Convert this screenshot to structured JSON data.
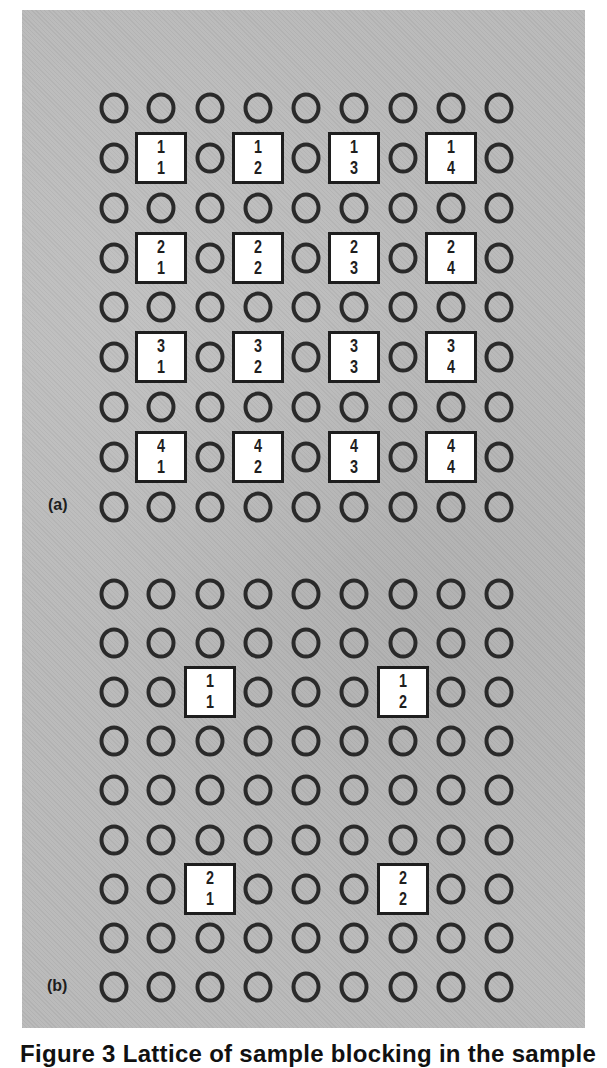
{
  "figure": {
    "caption": "Figure 3 Lattice of sample blocking in the sample",
    "colors": {
      "panel_background": "#b9b9b9",
      "circle_stroke": "#2a2a2a",
      "box_fill": "#ffffff",
      "box_stroke": "#1e1e1e"
    },
    "panels": [
      {
        "label": "(a)",
        "label_pos": {
          "x": 48,
          "y": 496
        },
        "grid": {
          "rows": 9,
          "cols": 9,
          "col_centers": [
            114,
            161,
            210,
            258,
            306,
            354,
            403,
            451,
            499
          ],
          "row_centers": [
            108,
            158,
            208,
            258,
            307,
            357,
            407,
            457,
            507
          ]
        },
        "blocks": [
          {
            "row": 1,
            "col": 1,
            "top": "1",
            "bottom": "1"
          },
          {
            "row": 1,
            "col": 3,
            "top": "1",
            "bottom": "2"
          },
          {
            "row": 1,
            "col": 5,
            "top": "1",
            "bottom": "3"
          },
          {
            "row": 1,
            "col": 7,
            "top": "1",
            "bottom": "4"
          },
          {
            "row": 3,
            "col": 1,
            "top": "2",
            "bottom": "1"
          },
          {
            "row": 3,
            "col": 3,
            "top": "2",
            "bottom": "2"
          },
          {
            "row": 3,
            "col": 5,
            "top": "2",
            "bottom": "3"
          },
          {
            "row": 3,
            "col": 7,
            "top": "2",
            "bottom": "4"
          },
          {
            "row": 5,
            "col": 1,
            "top": "3",
            "bottom": "1"
          },
          {
            "row": 5,
            "col": 3,
            "top": "3",
            "bottom": "2"
          },
          {
            "row": 5,
            "col": 5,
            "top": "3",
            "bottom": "3"
          },
          {
            "row": 5,
            "col": 7,
            "top": "3",
            "bottom": "4"
          },
          {
            "row": 7,
            "col": 1,
            "top": "4",
            "bottom": "1"
          },
          {
            "row": 7,
            "col": 3,
            "top": "4",
            "bottom": "2"
          },
          {
            "row": 7,
            "col": 5,
            "top": "4",
            "bottom": "3"
          },
          {
            "row": 7,
            "col": 7,
            "top": "4",
            "bottom": "4"
          }
        ]
      },
      {
        "label": "(b)",
        "label_pos": {
          "x": 47,
          "y": 977
        },
        "grid": {
          "rows": 9,
          "cols": 9,
          "col_centers": [
            114,
            161,
            210,
            258,
            306,
            354,
            403,
            451,
            499
          ],
          "row_centers": [
            594,
            643,
            692,
            741,
            790,
            840,
            889,
            938,
            987
          ]
        },
        "blocks": [
          {
            "row": 2,
            "col": 2,
            "top": "1",
            "bottom": "1"
          },
          {
            "row": 2,
            "col": 6,
            "top": "1",
            "bottom": "2"
          },
          {
            "row": 6,
            "col": 2,
            "top": "2",
            "bottom": "1"
          },
          {
            "row": 6,
            "col": 6,
            "top": "2",
            "bottom": "2"
          }
        ]
      }
    ]
  }
}
